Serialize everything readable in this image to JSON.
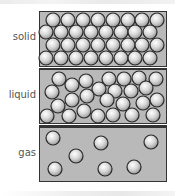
{
  "diagram": {
    "colors": {
      "panel_fill": "#b9b9b9",
      "panel_border": "#333333",
      "particle_light": "#ffffff",
      "particle_mid": "#d6d6d6",
      "particle_dark": "#9a9a9a",
      "particle_outline": "#2a2a2a",
      "label_text": "#555555"
    },
    "particle_radius": 7,
    "panels": [
      {
        "id": "solid",
        "label": "solid",
        "box": {
          "x": 39,
          "y": 11,
          "w": 128,
          "h": 56
        },
        "particles": [
          [
            53,
            20
          ],
          [
            68,
            20
          ],
          [
            83,
            20
          ],
          [
            98,
            20
          ],
          [
            113,
            20
          ],
          [
            128,
            20
          ],
          [
            142,
            20
          ],
          [
            157,
            20
          ],
          [
            46,
            32
          ],
          [
            61,
            32
          ],
          [
            76,
            32
          ],
          [
            91,
            32
          ],
          [
            106,
            32
          ],
          [
            121,
            32
          ],
          [
            135,
            32
          ],
          [
            150,
            32
          ],
          [
            53,
            45
          ],
          [
            68,
            45
          ],
          [
            83,
            45
          ],
          [
            98,
            45
          ],
          [
            113,
            45
          ],
          [
            128,
            45
          ],
          [
            142,
            45
          ],
          [
            157,
            45
          ],
          [
            46,
            58
          ],
          [
            61,
            58
          ],
          [
            76,
            58
          ],
          [
            91,
            58
          ],
          [
            106,
            58
          ],
          [
            121,
            58
          ],
          [
            135,
            58
          ],
          [
            150,
            58
          ]
        ]
      },
      {
        "id": "liquid",
        "label": "liquid",
        "box": {
          "x": 39,
          "y": 69,
          "w": 128,
          "h": 55
        },
        "particles": [
          [
            59,
            79
          ],
          [
            72,
            85
          ],
          [
            86,
            81
          ],
          [
            109,
            79
          ],
          [
            124,
            79
          ],
          [
            139,
            78
          ],
          [
            156,
            79
          ],
          [
            52,
            92
          ],
          [
            99,
            89
          ],
          [
            115,
            91
          ],
          [
            131,
            91
          ],
          [
            146,
            88
          ],
          [
            72,
            100
          ],
          [
            87,
            96
          ],
          [
            107,
            100
          ],
          [
            123,
            104
          ],
          [
            143,
            103
          ],
          [
            157,
            100
          ],
          [
            58,
            106
          ],
          [
            84,
            111
          ],
          [
            47,
            116
          ],
          [
            69,
            116
          ],
          [
            98,
            116
          ],
          [
            113,
            115
          ],
          [
            132,
            115
          ],
          [
            153,
            115
          ]
        ]
      },
      {
        "id": "gas",
        "label": "gas",
        "box": {
          "x": 39,
          "y": 127,
          "w": 128,
          "h": 55
        },
        "particles": [
          [
            53,
            138
          ],
          [
            101,
            143
          ],
          [
            151,
            142
          ],
          [
            76,
            156
          ],
          [
            55,
            169
          ],
          [
            105,
            169
          ],
          [
            134,
            167
          ]
        ]
      }
    ]
  }
}
